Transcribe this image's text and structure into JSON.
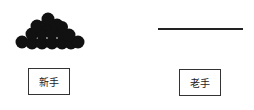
{
  "diagram": {
    "left": {
      "figure": "circle-pile",
      "label": "新手"
    },
    "right": {
      "figure": "flat-line",
      "label": "老手"
    }
  }
}
